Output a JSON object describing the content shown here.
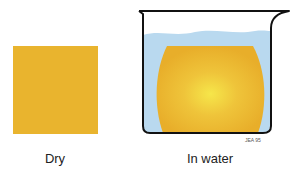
{
  "diagram": {
    "panels": [
      {
        "id": "dry",
        "label": "Dry"
      },
      {
        "id": "in-water",
        "label": "In water"
      }
    ],
    "signature": "JEA 95",
    "colors": {
      "sponge": "#e8b22c",
      "sponge_center": "#f5e14a",
      "water": "#b8d8ee",
      "outline": "#111111"
    }
  }
}
